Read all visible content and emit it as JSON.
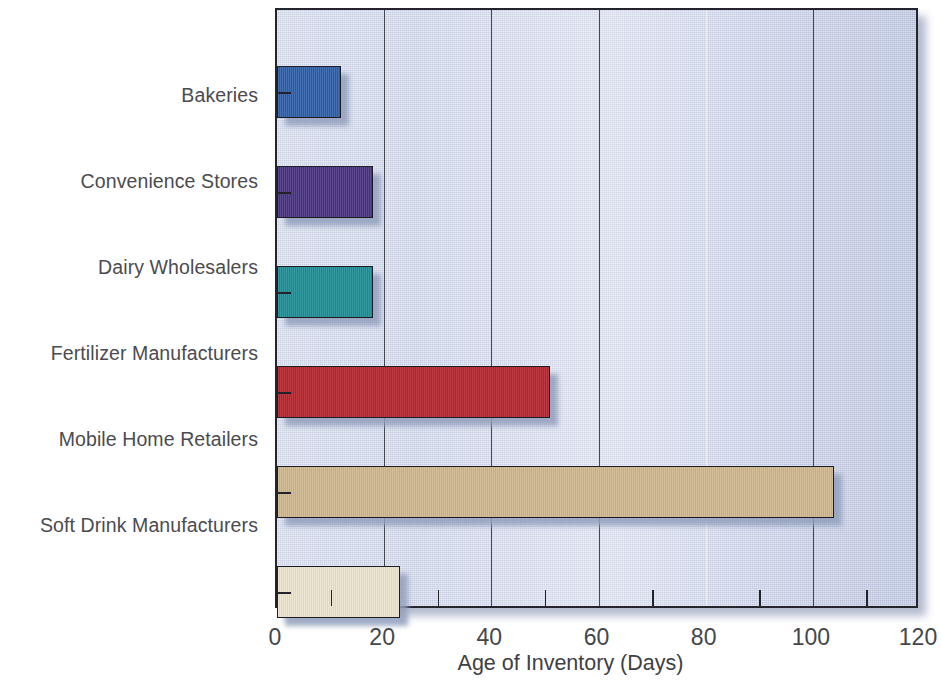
{
  "chart_data": {
    "type": "bar",
    "orientation": "horizontal",
    "title": "",
    "subtitle": "",
    "xlabel": "Age of Inventory (Days)",
    "ylabel": "",
    "categories": [
      "Bakeries",
      "Convenience Stores",
      "Dairy Wholesalers",
      "Fertilizer Manufacturers",
      "Mobile Home Retailers",
      "Soft Drink Manufacturers"
    ],
    "values": [
      12,
      18,
      18,
      51,
      104,
      23
    ],
    "bar_colors": [
      "#2f5fa8",
      "#4a3480",
      "#1e8e96",
      "#b8252f",
      "#cfb78f",
      "#ebe3ce"
    ],
    "xlim": [
      0,
      120
    ],
    "ylim": [
      0,
      6
    ],
    "xticks": [
      0,
      20,
      40,
      60,
      80,
      100,
      120
    ],
    "xtick_labels": [
      "0",
      "20",
      "40",
      "60",
      "80",
      "100",
      "120"
    ],
    "xminor_ticks": [
      10,
      30,
      50,
      70,
      90,
      110
    ],
    "gridlines_x": [
      20,
      40,
      60,
      80,
      100
    ],
    "grid": true,
    "legend": "none",
    "plot_background": "#ccd3e6",
    "axis_color": "#24252c",
    "label_color": "#4b4b50"
  },
  "axis": {
    "x_title": "Age of Inventory (Days)"
  }
}
